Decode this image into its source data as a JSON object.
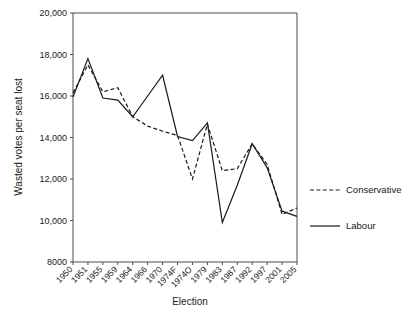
{
  "chart_data": {
    "type": "line",
    "title": "",
    "xlabel": "Election",
    "ylabel": "Wasted votes per seat lost",
    "categories": [
      "1950",
      "1951",
      "1955",
      "1959",
      "1964",
      "1966",
      "1970",
      "1974F",
      "1974O",
      "1979",
      "1983",
      "1987",
      "1992",
      "1997",
      "2001",
      "2005"
    ],
    "ylim": [
      8000,
      20000
    ],
    "ytick_labels": [
      "20,000",
      "18,000",
      "16,000",
      "14,000",
      "12,000",
      "10,000",
      "8000"
    ],
    "ytick_values": [
      20000,
      18000,
      16000,
      14000,
      12000,
      10000,
      8000
    ],
    "grid": false,
    "legend_position": "right",
    "series": [
      {
        "name": "Conservative",
        "style": "dashed",
        "color": "#1a1a1a",
        "values": [
          16150,
          17500,
          16200,
          16400,
          15000,
          14550,
          14300,
          14100,
          12000,
          14650,
          12400,
          12500,
          13700,
          12700,
          10300,
          10600
        ]
      },
      {
        "name": "Labour",
        "style": "solid",
        "color": "#1a1a1a",
        "values": [
          15950,
          17800,
          15900,
          15800,
          15000,
          16000,
          17000,
          14050,
          13850,
          14700,
          9900,
          11700,
          13700,
          12550,
          10450,
          10200
        ]
      }
    ]
  },
  "legend": {
    "items": [
      {
        "label": "Conservative",
        "style": "dashed"
      },
      {
        "label": "Labour",
        "style": "solid"
      }
    ]
  },
  "axes": {
    "x_title": "Election",
    "y_title": "Wasted votes per seat lost"
  }
}
